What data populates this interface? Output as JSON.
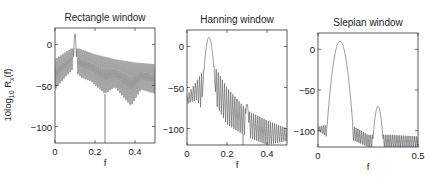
{
  "figure": {
    "ylabel_main": "10log",
    "ylabel_sub1": "10",
    "ylabel_mid": " R",
    "ylabel_sub2": "x",
    "ylabel_end": "(f)",
    "line_color": "#555555"
  },
  "chart_data": [
    {
      "type": "line",
      "title": "Rectangle window",
      "xlabel": "f",
      "ylabel": "10log10 Rx(f)",
      "xlim": [
        0,
        0.5
      ],
      "ylim": [
        -120,
        20
      ],
      "xticks": [
        0,
        0.2,
        0.4
      ],
      "xtick_labels": [
        "0",
        "0.2",
        "0.4"
      ],
      "yticks": [
        0,
        -50,
        -100
      ],
      "ytick_labels": [
        "0",
        "-50",
        "-100"
      ],
      "grid": false,
      "main_lobe": {
        "center": 0.1,
        "peak_db": 13,
        "halfwidth": 0.008
      },
      "secondary_lobe": null,
      "envelope_upper": [
        [
          0,
          -18
        ],
        [
          0.08,
          -5
        ],
        [
          0.12,
          -5
        ],
        [
          0.2,
          -12
        ],
        [
          0.3,
          -18
        ],
        [
          0.4,
          -22
        ],
        [
          0.5,
          -24
        ]
      ],
      "envelope_lower": [
        [
          0,
          -55
        ],
        [
          0.05,
          -40
        ],
        [
          0.09,
          -30
        ],
        [
          0.13,
          -40
        ],
        [
          0.18,
          -45
        ],
        [
          0.25,
          -60
        ],
        [
          0.3,
          -52
        ],
        [
          0.38,
          -75
        ],
        [
          0.43,
          -55
        ],
        [
          0.5,
          -60
        ]
      ],
      "notch": {
        "f": 0.25,
        "db": -120
      },
      "ripple_count": 50
    },
    {
      "type": "line",
      "title": "Hanning window",
      "xlabel": "f",
      "ylabel": "",
      "xlim": [
        0,
        0.5
      ],
      "ylim": [
        -120,
        20
      ],
      "xticks": [
        0,
        0.2,
        0.4
      ],
      "xtick_labels": [
        "0",
        "0.2",
        "0.4"
      ],
      "yticks": [
        0,
        -50,
        -100
      ],
      "ytick_labels": [
        "0",
        "-50",
        "-100"
      ],
      "grid": false,
      "main_lobe": {
        "center": 0.11,
        "peak_db": 11,
        "halfwidth": 0.025
      },
      "secondary_lobe": {
        "center": 0.3,
        "peak_db": -70,
        "halfwidth": 0.012
      },
      "envelope_upper": [
        [
          0,
          -60
        ],
        [
          0.08,
          -30
        ],
        [
          0.1,
          -20
        ],
        [
          0.14,
          -25
        ],
        [
          0.2,
          -50
        ],
        [
          0.3,
          -78
        ],
        [
          0.4,
          -90
        ],
        [
          0.5,
          -100
        ]
      ],
      "envelope_lower": [
        [
          0,
          -70
        ],
        [
          0.05,
          -65
        ],
        [
          0.08,
          -80
        ],
        [
          0.12,
          -60
        ],
        [
          0.2,
          -95
        ],
        [
          0.3,
          -110
        ],
        [
          0.4,
          -120
        ],
        [
          0.5,
          -115
        ]
      ],
      "notch": {
        "f": 0.28,
        "db": -120
      },
      "ripple_count": 48
    },
    {
      "type": "line",
      "title": "Slepian window",
      "xlabel": "f",
      "ylabel": "",
      "xlim": [
        0,
        0.5
      ],
      "ylim": [
        -120,
        20
      ],
      "xticks": [
        0,
        0.5
      ],
      "xtick_labels": [
        "0",
        "0.5"
      ],
      "yticks": [
        0,
        -50,
        -100
      ],
      "ytick_labels": [
        "0",
        "-50",
        "-100"
      ],
      "grid": false,
      "main_lobe": {
        "center": 0.11,
        "peak_db": 10,
        "halfwidth": 0.04
      },
      "secondary_lobe": {
        "center": 0.3,
        "peak_db": -70,
        "halfwidth": 0.025
      },
      "envelope_upper": [
        [
          0,
          -95
        ],
        [
          0.06,
          -92
        ],
        [
          0.16,
          -92
        ],
        [
          0.25,
          -105
        ],
        [
          0.35,
          -105
        ],
        [
          0.5,
          -107
        ]
      ],
      "envelope_lower": [
        [
          0,
          -100
        ],
        [
          0.06,
          -110
        ],
        [
          0.16,
          -110
        ],
        [
          0.25,
          -120
        ],
        [
          0.35,
          -120
        ],
        [
          0.5,
          -120
        ]
      ],
      "notch": null,
      "ripple_count": 55
    }
  ],
  "panels": [
    {
      "title": "Rectangle window",
      "xlabel": "f"
    },
    {
      "title": "Hanning window",
      "xlabel": "f"
    },
    {
      "title": "Slepian window",
      "xlabel": "f"
    }
  ]
}
